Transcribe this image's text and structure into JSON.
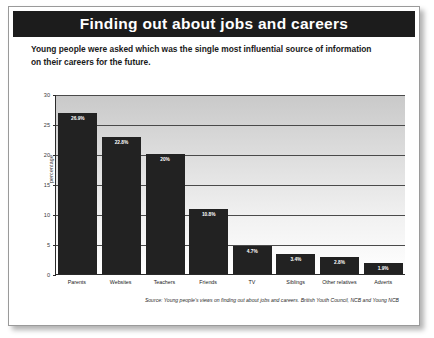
{
  "title": "Finding out about jobs and careers",
  "subtitle_line1": "Young people were asked which was the single most influential source of information",
  "subtitle_line2": "on their careers for the future.",
  "source": "Source: Young people's views on finding out about jobs and careers. British Youth Council, NCB and Young NCB",
  "colors": {
    "banner_background": "#1c1c1c",
    "banner_text": "#ffffff",
    "bar_fill": "#222222",
    "gridline": "#4a4a4a",
    "plot_top": "#c9c9c9",
    "plot_bottom": "#ffffff",
    "frame_border": "#9a9a9a"
  },
  "chart_data": {
    "type": "bar",
    "title": "Finding out about jobs and careers",
    "subtitle": "Young people were asked which was the single most influential source of information on their careers for the future.",
    "xlabel": "",
    "ylabel": "percentage",
    "ylim": [
      0,
      30
    ],
    "yticks": [
      0,
      5,
      10,
      15,
      20,
      25,
      30
    ],
    "ytick_labels": [
      "0",
      "5",
      "10",
      "15",
      "20",
      "25",
      "30"
    ],
    "grid": true,
    "legend": false,
    "categories": [
      "Parents",
      "Websites",
      "Teachers",
      "Friends",
      "TV",
      "Siblings",
      "Other relatives",
      "Adverts"
    ],
    "values": [
      26.9,
      22.8,
      20.0,
      10.8,
      4.7,
      3.4,
      2.8,
      1.9
    ],
    "data_labels": [
      "26.9%",
      "22.8%",
      "20%",
      "10.8%",
      "4.7%",
      "3.4%",
      "2.8%",
      "1.9%"
    ],
    "source": "Source: Young people's views on finding out about jobs and careers. British Youth Council, NCB and Young NCB"
  }
}
